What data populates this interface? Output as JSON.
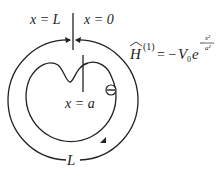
{
  "diagram": {
    "labels": {
      "left_boundary": "x = L",
      "right_boundary": "x = 0",
      "impurity_position": "x = a",
      "circumference": "L",
      "particle_symbol": "⊖"
    },
    "equation": {
      "lhs_symbol": "H",
      "lhs_hat": "^",
      "lhs_superscript": "(1)",
      "equals": "= −",
      "coefficient": "V",
      "coefficient_sub": "0",
      "base": "e",
      "exp_numerator": "x²",
      "exp_denominator": "a²",
      "exp_sign": "−"
    },
    "colors": {
      "stroke": "#222222",
      "background": "#ffffff"
    }
  }
}
